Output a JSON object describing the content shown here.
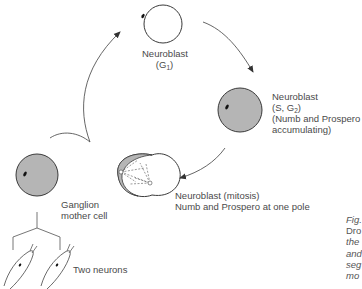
{
  "colors": {
    "cell_fill_gray": "#b5b5b5",
    "cell_stroke": "#3a3a3a",
    "arrow": "#555555",
    "text": "#4a4a4a",
    "background": "#ffffff"
  },
  "stages": {
    "g1": {
      "name": "Neuroblast",
      "phase_prefix": "(G",
      "phase_sub": "1",
      "phase_suffix": ")"
    },
    "s_g2": {
      "name": "Neuroblast",
      "phase_prefix": "(S, G",
      "phase_sub": "2",
      "phase_suffix": ")",
      "note_line1": "(Numb and Prospero",
      "note_line2": "accumulating)"
    },
    "mitosis": {
      "name": "Neuroblast (mitosis)",
      "note": "Numb and Prospero at one pole"
    },
    "gmc": {
      "line1": "Ganglion",
      "line2": "mother cell"
    },
    "neurons": {
      "label": "Two neurons"
    }
  },
  "caption": {
    "lines": [
      "Fig.",
      "Dro",
      "the",
      "and",
      "seg",
      "mo"
    ]
  }
}
